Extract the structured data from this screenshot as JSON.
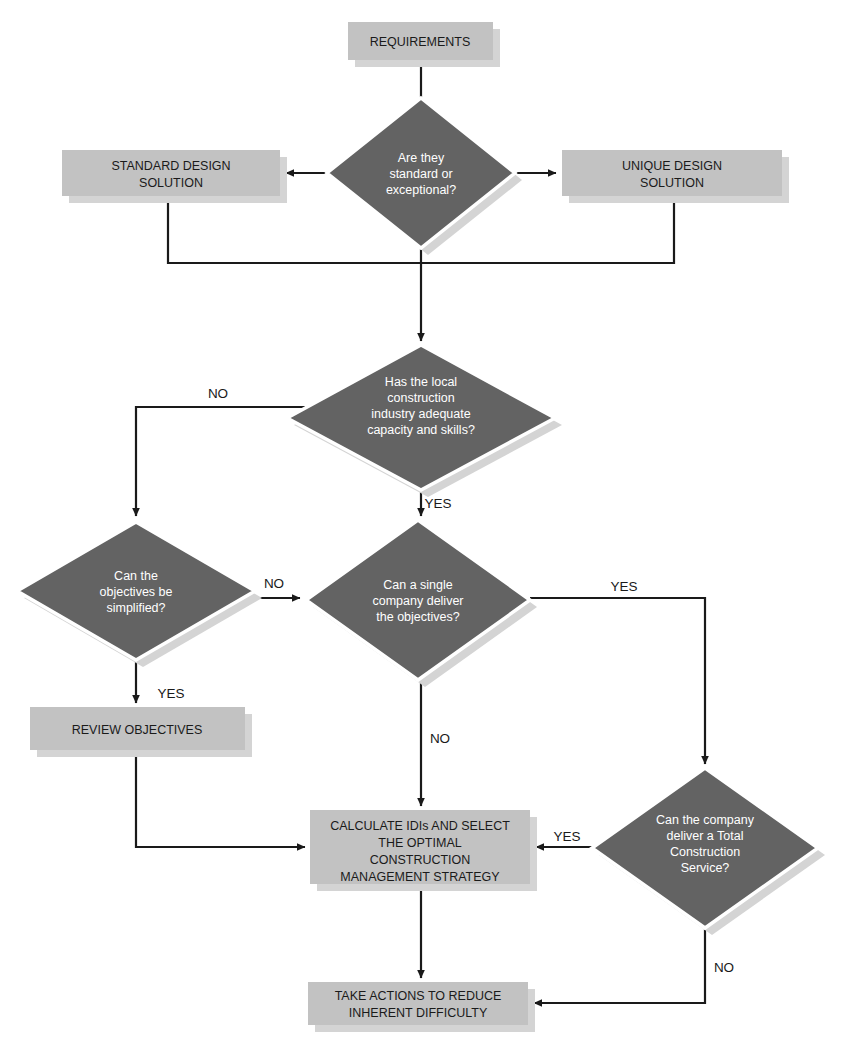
{
  "diagram": {
    "colors": {
      "process_fill": "#c2c2c2",
      "process_text": "#1a1a1a",
      "decision_fill": "#636363",
      "decision_text": "#ffffff",
      "decision_border": "#ffffff",
      "connector": "#1a1a1a",
      "shadow": "#d4d4d4",
      "background": "#ffffff"
    }
  },
  "nodes": {
    "requirements": {
      "label": "REQUIREMENTS",
      "type": "process"
    },
    "standard_design": {
      "label_line1": "STANDARD DESIGN",
      "label_line2": "SOLUTION",
      "type": "process"
    },
    "unique_design": {
      "label_line1": "UNIQUE DESIGN",
      "label_line2": "SOLUTION",
      "type": "process"
    },
    "q_standard_exceptional": {
      "type": "decision",
      "label_line1": "Are they",
      "label_line2": "standard or",
      "label_line3": "exceptional?"
    },
    "q_local_capacity": {
      "type": "decision",
      "label_line1": "Has the local",
      "label_line2": "construction",
      "label_line3": "industry adequate",
      "label_line4": "capacity and skills?"
    },
    "q_simplify_objectives": {
      "type": "decision",
      "label_line1": "Can the",
      "label_line2": "objectives be",
      "label_line3": "simplified?"
    },
    "q_single_company": {
      "type": "decision",
      "label_line1": "Can a single",
      "label_line2": "company deliver",
      "label_line3": "the objectives?"
    },
    "q_total_construction_service": {
      "type": "decision",
      "label_line1": "Can the company",
      "label_line2": "deliver a Total",
      "label_line3": "Construction",
      "label_line4": "Service?"
    },
    "review_objectives": {
      "label": "REVIEW OBJECTIVES",
      "type": "process"
    },
    "calculate_idis": {
      "type": "process",
      "label_line1": "CALCULATE IDIs AND SELECT",
      "label_line2": "THE OPTIMAL",
      "label_line3": "CONSTRUCTION",
      "label_line4": "MANAGEMENT STRATEGY"
    },
    "take_actions": {
      "type": "process",
      "label_line1": "TAKE ACTIONS TO REDUCE",
      "label_line2": "INHERENT DIFFICULTY"
    }
  },
  "edge_labels": {
    "capacity_no": "NO",
    "capacity_yes": "YES",
    "simplify_no": "NO",
    "simplify_yes": "YES",
    "single_company_yes": "YES",
    "single_company_no": "NO",
    "total_service_yes": "YES",
    "total_service_no": "NO"
  }
}
